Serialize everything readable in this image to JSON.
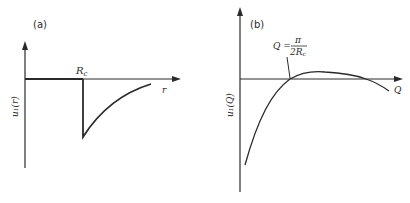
{
  "panels": [
    {
      "id": "a",
      "label": "(a)",
      "x_axis_label": "r",
      "y_axis_label": "u₁(r)",
      "marker_label": "R",
      "marker_subscript": "c",
      "description": "Potential zero for r < R_c, drops sharply at R_c to a negative minimum, then rises back toward zero"
    },
    {
      "id": "b",
      "label": "(b)",
      "x_axis_label": "Q",
      "y_axis_label": "u₁(Q)",
      "annotation": {
        "lhs": "Q =",
        "numerator": "π",
        "denominator": "2R",
        "denominator_subscript": "c"
      },
      "description": "Fourier transform: starts very negative, crosses zero at Q = π/(2R_c), small positive maximum, then crosses zero again and decreases"
    }
  ],
  "colors": {
    "line": "#2a2a2a",
    "background": "#ffffff"
  }
}
